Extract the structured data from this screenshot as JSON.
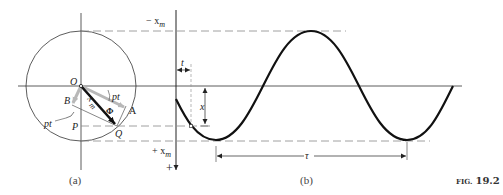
{
  "figure": {
    "label": "FIG. 19.2",
    "label_small": "FIG.",
    "label_num": "19.2",
    "panels": {
      "a": {
        "caption": "(a)",
        "points": {
          "O": "O",
          "A": "A",
          "B": "B",
          "P": "P",
          "Q": "Q"
        },
        "labels": {
          "pt_upper": "pt",
          "pt_lower": "pt",
          "xm": "x",
          "xm_sub": "m",
          "phi": "Φ"
        }
      },
      "b": {
        "caption": "(b)",
        "axis": {
          "neg_xm": "− x",
          "pos_xm": "+ x",
          "xm_sub": "m",
          "plus": "+"
        },
        "labels": {
          "t": "t",
          "x": "x",
          "tau": "τ"
        }
      }
    }
  },
  "colors": {
    "line": "#222222",
    "dash": "#888888",
    "gray_arrow": "#b8b8b8",
    "curve": "#111111"
  }
}
